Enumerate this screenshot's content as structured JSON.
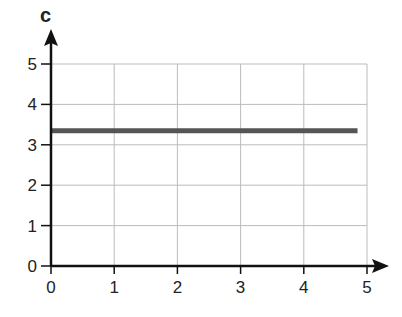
{
  "chart_data": {
    "type": "line",
    "title": "",
    "xlabel": "",
    "ylabel": "c",
    "xlim": [
      0,
      5
    ],
    "ylim": [
      0,
      5
    ],
    "grid": true,
    "legend": null,
    "x_ticks": [
      "0",
      "1",
      "2",
      "3",
      "4",
      "5"
    ],
    "y_ticks": [
      "0",
      "1",
      "2",
      "3",
      "4",
      "5"
    ],
    "series": [
      {
        "name": "c",
        "x": [
          0,
          4.85
        ],
        "y": [
          3.35,
          3.35
        ],
        "color": "#555555"
      }
    ]
  },
  "colors": {
    "axis": "#111111",
    "grid": "#bbbbbb",
    "line": "#555555"
  }
}
